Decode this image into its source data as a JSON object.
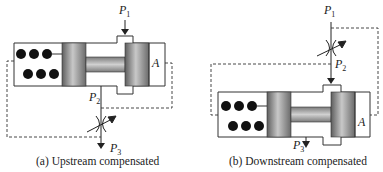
{
  "figure": {
    "panels": [
      {
        "id": "a",
        "caption": "(a) Upstream compensated",
        "labels": {
          "p1": "P",
          "p1_sub": "1",
          "p2": "P",
          "p2_sub": "2",
          "p3": "P",
          "p3_sub": "3",
          "area": "A"
        }
      },
      {
        "id": "b",
        "caption": "(b) Downstream compensated",
        "labels": {
          "p1": "P",
          "p1_sub": "1",
          "p2": "P",
          "p2_sub": "2",
          "p3": "P",
          "p3_sub": "3",
          "area": "A"
        }
      }
    ],
    "colors": {
      "line": "#333333",
      "piston_dark": "#6e6e6e",
      "piston_light": "#bdbdbd",
      "spring_dot": "#111111",
      "background": "#ffffff"
    }
  }
}
